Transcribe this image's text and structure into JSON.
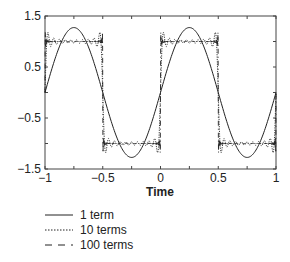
{
  "chart_data": {
    "type": "line",
    "title": "",
    "xlabel": "Time",
    "ylabel": "",
    "xlim": [
      -1,
      1
    ],
    "ylim": [
      -1.5,
      1.5
    ],
    "grid": false,
    "legend_position": "below",
    "xticks": [
      -1,
      -0.5,
      0,
      0.5,
      1
    ],
    "xtick_labels": [
      "−1",
      "−0.5",
      "0",
      "0.5",
      "1"
    ],
    "xminor_ticks": [
      -0.75,
      -0.25,
      0.25,
      0.75
    ],
    "yticks": [
      -1.5,
      -0.5,
      0.5,
      1.5
    ],
    "ytick_labels": [
      "−1.5",
      "−0.5",
      "0.5",
      "1.5"
    ],
    "yminor_ticks": [
      -1,
      0,
      1
    ],
    "series": [
      {
        "name": "1 term",
        "terms": 1,
        "style": "solid",
        "x": [
          -1,
          -0.75,
          -0.5,
          -0.25,
          0,
          0.25,
          0.5,
          0.75,
          1
        ],
        "values": [
          0,
          1.27,
          0,
          -1.27,
          0,
          1.27,
          0,
          -1.27,
          0
        ]
      },
      {
        "name": "10 terms",
        "terms": 10,
        "style": "dotted",
        "x": [
          -1,
          -0.75,
          -0.5,
          -0.25,
          0,
          0.25,
          0.5,
          0.75,
          1
        ],
        "values": [
          0,
          1,
          0,
          -1,
          0,
          1,
          0,
          -1,
          0
        ]
      },
      {
        "name": "100 terms",
        "terms": 100,
        "style": "dashed",
        "x": [
          -1,
          -0.75,
          -0.5,
          -0.25,
          0,
          0.25,
          0.5,
          0.75,
          1
        ],
        "values": [
          0,
          1,
          0,
          -1,
          0,
          1,
          0,
          -1,
          0
        ]
      }
    ]
  },
  "legend": [
    {
      "label": "1 term"
    },
    {
      "label": "10 terms"
    },
    {
      "label": "100 terms"
    }
  ]
}
